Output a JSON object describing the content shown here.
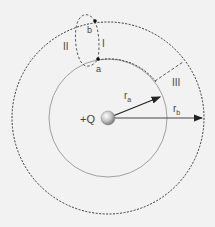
{
  "diagram": {
    "charge_label": "+Q",
    "point_a_label": "a",
    "point_b_label": "b",
    "path_labels": [
      "I",
      "II",
      "III"
    ],
    "radius_a_label": "r",
    "radius_a_sub": "a",
    "radius_b_label": "r",
    "radius_b_sub": "b"
  },
  "colors": {
    "background": "#f2f2f2",
    "line": "#333333",
    "inner_circle": "#8a8a8a",
    "sphere": "#c8c8c8"
  }
}
